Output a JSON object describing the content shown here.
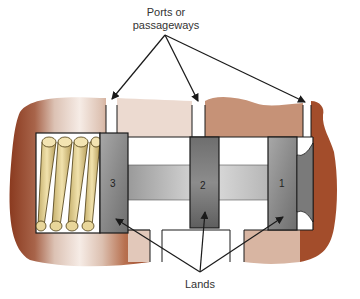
{
  "diagram": {
    "title_label_top": [
      "Ports or",
      "passageways"
    ],
    "title_label_bottom": "Lands",
    "lands": [
      {
        "number": "3"
      },
      {
        "number": "2"
      },
      {
        "number": "1"
      }
    ],
    "colors": {
      "housing_dark": "#8a3a1f",
      "housing_light": "#e6cfc3",
      "land_gray": "#8e8e8e",
      "stem_gray": "#b5b5b5",
      "spring": "#e3cf8f",
      "arrow": "#1a1a1a"
    }
  }
}
